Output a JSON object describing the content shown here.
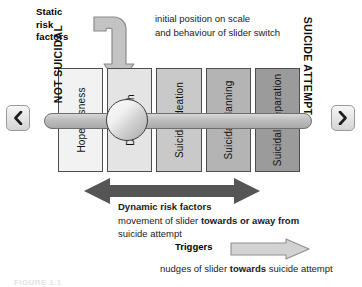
{
  "figure": {
    "caption": "FIGURE 1.1"
  },
  "annotations": {
    "static_risk_factors": "Static\nrisk\nfactors",
    "static_risk_factors_lines": [
      "Static",
      "risk",
      "factors"
    ],
    "initial_note_lines": [
      "initial position on scale",
      "and behaviour of slider switch"
    ]
  },
  "axis": {
    "left_label": "NOT SUICIDAL",
    "right_label": "SUICIDE ATTEMPT"
  },
  "nav": {
    "prev_icon": "chevron-left-icon",
    "next_icon": "chevron-right-icon"
  },
  "scale": {
    "boxes": [
      {
        "label": "Hopelessness",
        "shade": "#f2f2f2"
      },
      {
        "label": "Death wish",
        "shade": "#e4e4e4"
      },
      {
        "label": "Suicidal ideation",
        "shade": "#c9c9c9"
      },
      {
        "label": "Suicidal planning",
        "shade": "#b4b4b4"
      },
      {
        "label": "Suicidal preparation",
        "shade": "#9b9b9b"
      }
    ]
  },
  "slider": {
    "knob_name": "slider-knob",
    "bar_name": "slider-bar"
  },
  "dynamic": {
    "heading": "Dynamic risk factors",
    "line1_pre": "movement of slider ",
    "line1_bold": "towards or away from",
    "line2": "suicide attempt"
  },
  "triggers": {
    "label": "Triggers",
    "desc_pre": "nudges of slider ",
    "desc_bold": "towards",
    "desc_post": " suicide attempt"
  },
  "colors": {
    "arrow_dark": "#4a4a4a",
    "arrow_light": "#cfcfcf",
    "outline": "#4d4d4d"
  }
}
